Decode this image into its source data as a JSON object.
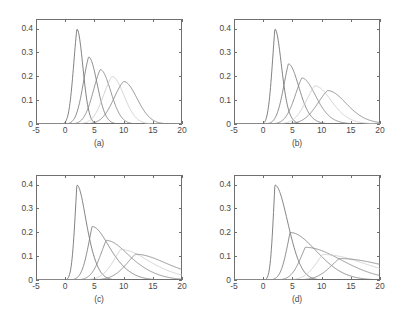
{
  "figure": {
    "background_color": "#ffffff",
    "axis_color": "#6f6f6f",
    "text_color": "#4a4a4a",
    "layout": "2x2 grid of line plots"
  },
  "axes": {
    "x_ticks": [
      "-5",
      "0",
      "5",
      "10",
      "15",
      "20"
    ],
    "x_tick_values": [
      -5,
      0,
      5,
      10,
      15,
      20
    ],
    "y_ticks": [
      "0",
      "0.1",
      "0.2",
      "0.3",
      "0.4"
    ],
    "y_tick_values": [
      0,
      0.1,
      0.2,
      0.3,
      0.4
    ],
    "xlim": [
      -5,
      20
    ],
    "ylim": [
      0,
      0.44
    ]
  },
  "captions": {
    "a": "(a)",
    "b": "(b)",
    "c": "(c)",
    "d": "(d)"
  },
  "curve_colors": [
    "#6b6b6b",
    "#777777",
    "#828282",
    "#c9c9c9",
    "#808080"
  ],
  "chart_data": [
    {
      "type": "line",
      "title": "(a)",
      "xlabel": "",
      "ylabel": "",
      "xlim": [
        -5,
        20
      ],
      "ylim": [
        0,
        0.44
      ],
      "xticks": [
        -5,
        0,
        5,
        10,
        15,
        20
      ],
      "yticks": [
        0,
        0.1,
        0.2,
        0.3,
        0.4
      ],
      "grid": false,
      "legend": "none",
      "description": "Five unimodal density curves with increasing mean and decreasing peak height; nearly symmetric bell shapes.",
      "series": [
        {
          "name": "curve-1",
          "peak_x": 2.0,
          "peak_y": 0.398,
          "width": 1.0,
          "skew": 0.15,
          "color": "#6b6b6b"
        },
        {
          "name": "curve-2",
          "peak_x": 4.0,
          "peak_y": 0.281,
          "width": 1.42,
          "skew": 0.15,
          "color": "#777777"
        },
        {
          "name": "curve-3",
          "peak_x": 6.0,
          "peak_y": 0.228,
          "width": 1.74,
          "skew": 0.15,
          "color": "#828282"
        },
        {
          "name": "curve-4",
          "peak_x": 8.0,
          "peak_y": 0.199,
          "width": 2.0,
          "skew": 0.15,
          "color": "#c9c9c9"
        },
        {
          "name": "curve-5",
          "peak_x": 10.0,
          "peak_y": 0.178,
          "width": 2.24,
          "skew": 0.15,
          "color": "#808080"
        }
      ]
    },
    {
      "type": "line",
      "title": "(b)",
      "xlabel": "",
      "ylabel": "",
      "xlim": [
        -5,
        20
      ],
      "ylim": [
        0,
        0.44
      ],
      "xticks": [
        -5,
        0,
        5,
        10,
        15,
        20
      ],
      "yticks": [
        0,
        0.1,
        0.2,
        0.3,
        0.4
      ],
      "grid": false,
      "legend": "none",
      "description": "Five density curves, broader and slightly right-skewed compared with panel (a); peaks lower and shifted right.",
      "series": [
        {
          "name": "curve-1",
          "peak_x": 2.0,
          "peak_y": 0.398,
          "width": 1.0,
          "skew": 0.4,
          "color": "#6b6b6b"
        },
        {
          "name": "curve-2",
          "peak_x": 4.3,
          "peak_y": 0.252,
          "width": 1.6,
          "skew": 0.4,
          "color": "#777777"
        },
        {
          "name": "curve-3",
          "peak_x": 6.6,
          "peak_y": 0.193,
          "width": 2.1,
          "skew": 0.4,
          "color": "#828282"
        },
        {
          "name": "curve-4",
          "peak_x": 8.8,
          "peak_y": 0.16,
          "width": 2.5,
          "skew": 0.4,
          "color": "#c9c9c9"
        },
        {
          "name": "curve-5",
          "peak_x": 11.0,
          "peak_y": 0.14,
          "width": 2.85,
          "skew": 0.4,
          "color": "#808080"
        }
      ]
    },
    {
      "type": "line",
      "title": "(c)",
      "xlabel": "",
      "ylabel": "",
      "xlim": [
        -5,
        20
      ],
      "ylim": [
        0,
        0.44
      ],
      "xticks": [
        -5,
        0,
        5,
        10,
        15,
        20
      ],
      "yticks": [
        0,
        0.1,
        0.2,
        0.3,
        0.4
      ],
      "grid": false,
      "legend": "none",
      "description": "Five strongly right-skewed density curves all rising from near x=-0.5; peaks progressively lower and further right.",
      "series": [
        {
          "name": "curve-1",
          "peak_x": 2.0,
          "peak_y": 0.398,
          "width": 1.05,
          "skew": 0.75,
          "color": "#6b6b6b"
        },
        {
          "name": "curve-2",
          "peak_x": 4.6,
          "peak_y": 0.224,
          "width": 1.95,
          "skew": 0.75,
          "color": "#777777"
        },
        {
          "name": "curve-3",
          "peak_x": 7.0,
          "peak_y": 0.166,
          "width": 2.6,
          "skew": 0.75,
          "color": "#828282"
        },
        {
          "name": "curve-4",
          "peak_x": 9.5,
          "peak_y": 0.128,
          "width": 3.2,
          "skew": 0.75,
          "color": "#c9c9c9"
        },
        {
          "name": "curve-5",
          "peak_x": 12.0,
          "peak_y": 0.108,
          "width": 3.7,
          "skew": 0.75,
          "color": "#808080"
        }
      ]
    },
    {
      "type": "line",
      "title": "(d)",
      "xlabel": "",
      "ylabel": "",
      "xlim": [
        -5,
        20
      ],
      "ylim": [
        0,
        0.44
      ],
      "xticks": [
        -5,
        0,
        5,
        10,
        15,
        20
      ],
      "yticks": [
        0,
        0.1,
        0.2,
        0.3,
        0.4
      ],
      "grid": false,
      "legend": "none",
      "description": "Five highly skewed, flat density curves; the widest spread of the four panels, last peak near x=13 with height ~0.09.",
      "series": [
        {
          "name": "curve-1",
          "peak_x": 2.0,
          "peak_y": 0.398,
          "width": 1.1,
          "skew": 0.95,
          "color": "#6b6b6b"
        },
        {
          "name": "curve-2",
          "peak_x": 4.6,
          "peak_y": 0.199,
          "width": 2.25,
          "skew": 0.95,
          "color": "#777777"
        },
        {
          "name": "curve-3",
          "peak_x": 7.2,
          "peak_y": 0.137,
          "width": 3.1,
          "skew": 0.95,
          "color": "#828282"
        },
        {
          "name": "curve-4",
          "peak_x": 10.2,
          "peak_y": 0.107,
          "width": 3.8,
          "skew": 0.95,
          "color": "#c9c9c9"
        },
        {
          "name": "curve-5",
          "peak_x": 13.0,
          "peak_y": 0.09,
          "width": 4.4,
          "skew": 0.95,
          "color": "#808080"
        }
      ]
    }
  ]
}
